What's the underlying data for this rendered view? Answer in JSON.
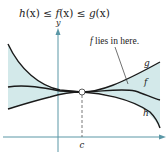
{
  "title": {
    "h": "h",
    "x1": "(x)",
    "le1": " ≤ ",
    "f": "f",
    "x2": "(x)",
    "le2": " ≤ ",
    "g": "g",
    "x3": "(x)"
  },
  "axes": {
    "y_label": "y",
    "c_label": "c"
  },
  "annotation": {
    "f_part": "f",
    "rest": " lies in here."
  },
  "curve_labels": {
    "g": "g",
    "f": "f",
    "h": "h"
  },
  "colors": {
    "region_fill": "#d3e9ea",
    "axis": "#5a97a6",
    "curve": "#1a1a1a",
    "dashed": "#555555"
  },
  "concept": "Squeeze theorem: h(x) ≤ f(x) ≤ g(x), all three meet at x = c"
}
